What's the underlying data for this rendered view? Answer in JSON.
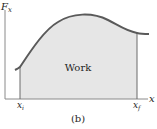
{
  "diagram": {
    "y_axis_label": "F",
    "y_axis_subscript": "x",
    "x_axis_label": "x",
    "area_label": "Work",
    "x_initial_label": "x",
    "x_initial_subscript": "i",
    "x_final_label": "x",
    "x_final_subscript": "f",
    "caption": "(b)",
    "colors": {
      "curve": "#5a5a5a",
      "fill": "#e6e6e6",
      "axes": "#8a8a8a",
      "bounds": "#6a6a6a",
      "text": "#1e1e1e"
    }
  }
}
